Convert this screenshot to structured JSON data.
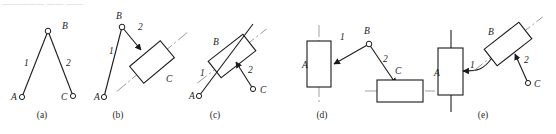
{
  "sheet": {
    "top_cut_text": "————— —— ——",
    "stroke_color": "#1b1b1b",
    "center_line_color": "#8c8c8c",
    "background": "#ffffff"
  },
  "figures": [
    {
      "id": "a",
      "caption": "(a)",
      "caption_x": 42,
      "caption_y": 117,
      "description": "two-link chain with three revolute pins",
      "joints": [
        {
          "name": "A",
          "type": "revolute-pin",
          "x": 22,
          "y": 97,
          "label": "A",
          "label_x": 11,
          "label_y": 100
        },
        {
          "name": "B",
          "type": "revolute-pin",
          "x": 48,
          "y": 31,
          "label": "B",
          "label_x": 62,
          "label_y": 29
        },
        {
          "name": "C",
          "type": "revolute-pin",
          "x": 73,
          "y": 96,
          "label": "C",
          "label_x": 61,
          "label_y": 100
        }
      ],
      "links": [
        {
          "name": "1",
          "from": "A",
          "to": "B",
          "label": "1",
          "label_x": 24,
          "label_y": 66
        },
        {
          "name": "2",
          "from": "B",
          "to": "C",
          "label": "2",
          "label_x": 66,
          "label_y": 66
        }
      ]
    },
    {
      "id": "b",
      "caption": "(b)",
      "caption_x": 118,
      "caption_y": 117,
      "description": "link 1 pinned at A and B, link 2 fixed into slider block C on an inclined guide",
      "joints": [
        {
          "name": "A",
          "type": "revolute-pin",
          "x": 104,
          "y": 97,
          "label": "A",
          "label_x": 94,
          "label_y": 100
        },
        {
          "name": "B",
          "type": "revolute-pin",
          "x": 122,
          "y": 27,
          "label": "B",
          "label_x": 116,
          "label_y": 19
        }
      ],
      "links": [
        {
          "name": "1",
          "from": "A",
          "to": "B",
          "label": "1",
          "label_x": 109,
          "label_y": 54
        },
        {
          "name": "2",
          "from": "B",
          "to": "block-C",
          "label": "2",
          "label_x": 138,
          "label_y": 30
        }
      ],
      "block": {
        "name": "C",
        "label": "C",
        "label_x": 166,
        "label_y": 82,
        "cx": 152,
        "cy": 62,
        "w": 40,
        "h": 22,
        "angle": -40,
        "guide_extend": 26
      }
    },
    {
      "id": "c",
      "caption": "(c)",
      "caption_x": 215,
      "caption_y": 117,
      "description": "slider block B on inclined guide rod 1 pinned at A, link 2 fixed to block and pinned at C",
      "joints": [
        {
          "name": "A",
          "type": "revolute-pin",
          "x": 199,
          "y": 96,
          "label": "A",
          "label_x": 189,
          "label_y": 99
        },
        {
          "name": "C",
          "type": "revolute-pin",
          "x": 253,
          "y": 89,
          "label": "C",
          "label_x": 260,
          "label_y": 93
        }
      ],
      "links": [
        {
          "name": "1",
          "from": "A",
          "to": "block-B",
          "label": "1",
          "label_x": 200,
          "label_y": 76
        },
        {
          "name": "2",
          "from": "block-B",
          "to": "C",
          "label": "2",
          "label_x": 248,
          "label_y": 73
        }
      ],
      "block": {
        "name": "B",
        "label": "B",
        "label_x": 213,
        "label_y": 45,
        "cx": 232,
        "cy": 56,
        "w": 44,
        "h": 21,
        "angle": -38,
        "guide_extend": 22
      }
    },
    {
      "id": "d",
      "caption": "(d)",
      "caption_x": 322,
      "caption_y": 117,
      "description": "vertical slider block A, link 1, pin B, link 2 fixed into horizontal slider block C",
      "joints": [
        {
          "name": "B",
          "type": "revolute-pin",
          "x": 369,
          "y": 44,
          "label": "B",
          "label_x": 364,
          "label_y": 34
        }
      ],
      "links": [
        {
          "name": "1",
          "from": "block-A",
          "to": "B",
          "label": "1",
          "label_x": 340,
          "label_y": 40
        },
        {
          "name": "2",
          "from": "B",
          "to": "block-C",
          "label": "2",
          "label_x": 383,
          "label_y": 62
        }
      ],
      "blocks": [
        {
          "name": "A",
          "label": "A",
          "label_x": 302,
          "label_y": 68,
          "cx": 319,
          "cy": 64,
          "w": 24,
          "h": 46,
          "angle": 0,
          "guide_extend": 16,
          "guide_dir": "vertical"
        },
        {
          "name": "C",
          "label": "C",
          "label_x": 395,
          "label_y": 74,
          "cx": 400,
          "cy": 91,
          "w": 46,
          "h": 22,
          "angle": 0,
          "guide_extend": 22,
          "guide_dir": "horizontal"
        }
      ]
    },
    {
      "id": "e",
      "caption": "(e)",
      "caption_x": 483,
      "caption_y": 117,
      "description": "vertical slider block A, curved link 1, inclined slider block B, link 2 pinned at C",
      "joints": [
        {
          "name": "C",
          "type": "revolute-pin",
          "x": 528,
          "y": 83,
          "label": "C",
          "label_x": 534,
          "label_y": 87
        }
      ],
      "links": [
        {
          "name": "1",
          "from": "block-A",
          "to": "block-B",
          "label": "1",
          "label_x": 470,
          "label_y": 68,
          "shape": "curved"
        },
        {
          "name": "2",
          "from": "block-B",
          "to": "C",
          "label": "2",
          "label_x": 524,
          "label_y": 63
        }
      ],
      "blocks": [
        {
          "name": "A",
          "label": "A",
          "label_x": 434,
          "label_y": 76,
          "cx": 451,
          "cy": 72,
          "w": 25,
          "h": 47,
          "angle": 0,
          "guide_extend": 18,
          "guide_dir": "vertical"
        },
        {
          "name": "B",
          "label": "B",
          "label_x": 488,
          "label_y": 35,
          "cx": 508,
          "cy": 44,
          "w": 44,
          "h": 21,
          "angle": -38,
          "guide_extend": 20
        }
      ]
    }
  ]
}
